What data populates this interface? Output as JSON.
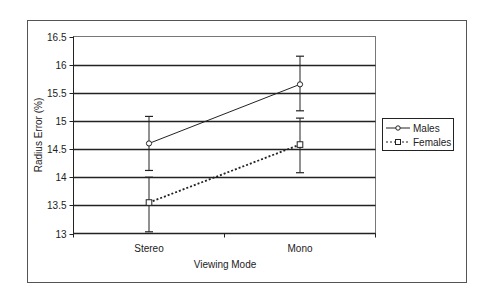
{
  "chart_data": {
    "type": "line",
    "title": "",
    "xlabel": "Viewing Mode",
    "ylabel": "Radius Error (%)",
    "categories": [
      "Stereo",
      "Mono"
    ],
    "ylim": [
      13,
      16.5
    ],
    "yticks": [
      "16.5",
      "16",
      "15.5",
      "15",
      "14.5",
      "14",
      "13.5",
      "13"
    ],
    "grid": true,
    "legend_position": "right",
    "series": [
      {
        "name": "Males",
        "values": [
          14.6,
          15.65
        ],
        "error_upper": [
          15.08,
          16.15
        ],
        "error_lower": [
          14.12,
          15.18
        ],
        "line_style": "solid",
        "marker": "circle"
      },
      {
        "name": "Females",
        "values": [
          13.55,
          14.58
        ],
        "error_upper": [
          14.0,
          15.05
        ],
        "error_lower": [
          13.03,
          14.08
        ],
        "line_style": "dotted",
        "marker": "square"
      }
    ]
  },
  "legend": {
    "males_label": "Males",
    "females_label": "Females"
  }
}
